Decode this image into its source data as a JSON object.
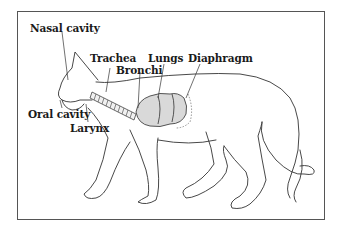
{
  "diagram": {
    "labels": {
      "nasal_cavity": "Nasal cavity",
      "trachea": "Trachea",
      "bronchi": "Bronchi",
      "lungs": "Lungs",
      "diaphragm": "Diaphragm",
      "oral_cavity": "Oral cavity",
      "larynx": "Larynx"
    },
    "colors": {
      "outline": "#333333",
      "frame": "#555555",
      "lung_fill": "#d9d9d9",
      "text": "#1a1a1a"
    }
  }
}
